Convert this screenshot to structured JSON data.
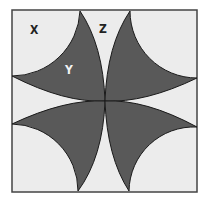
{
  "diagram": {
    "type": "geometric-figure",
    "colors": {
      "background": "#ececec",
      "fill": "#595959",
      "stroke": "#1a1a1a",
      "page": "#ffffff"
    },
    "square": {
      "x": 12,
      "y": 10,
      "width": 185,
      "height": 182
    },
    "center": {
      "x": 105,
      "y": 101
    },
    "labels": [
      {
        "id": "X",
        "text": "X",
        "x": 34,
        "y": 33,
        "region": "top-left white corner region"
      },
      {
        "id": "Y",
        "text": "Y",
        "x": 69,
        "y": 73,
        "region": "top-left shaded petal"
      },
      {
        "id": "Z",
        "text": "Z",
        "x": 103,
        "y": 32,
        "region": "top white gap between petals"
      }
    ]
  }
}
